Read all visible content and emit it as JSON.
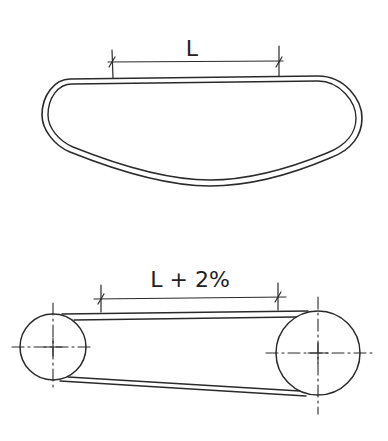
{
  "diagram": {
    "top": {
      "label": "L",
      "description": "Belt laid flat / unstretched, measured straight span L"
    },
    "bottom": {
      "label": "L + 2%",
      "description": "Belt installed on two pulleys, span stretched to L + 2%",
      "pulleys": [
        {
          "name": "left-pulley",
          "cx": 53,
          "cy": 347,
          "r": 33
        },
        {
          "name": "right-pulley",
          "cx": 318,
          "cy": 353,
          "r": 42
        }
      ]
    },
    "colors": {
      "line": "#2a2a2a",
      "background": "#ffffff"
    }
  }
}
